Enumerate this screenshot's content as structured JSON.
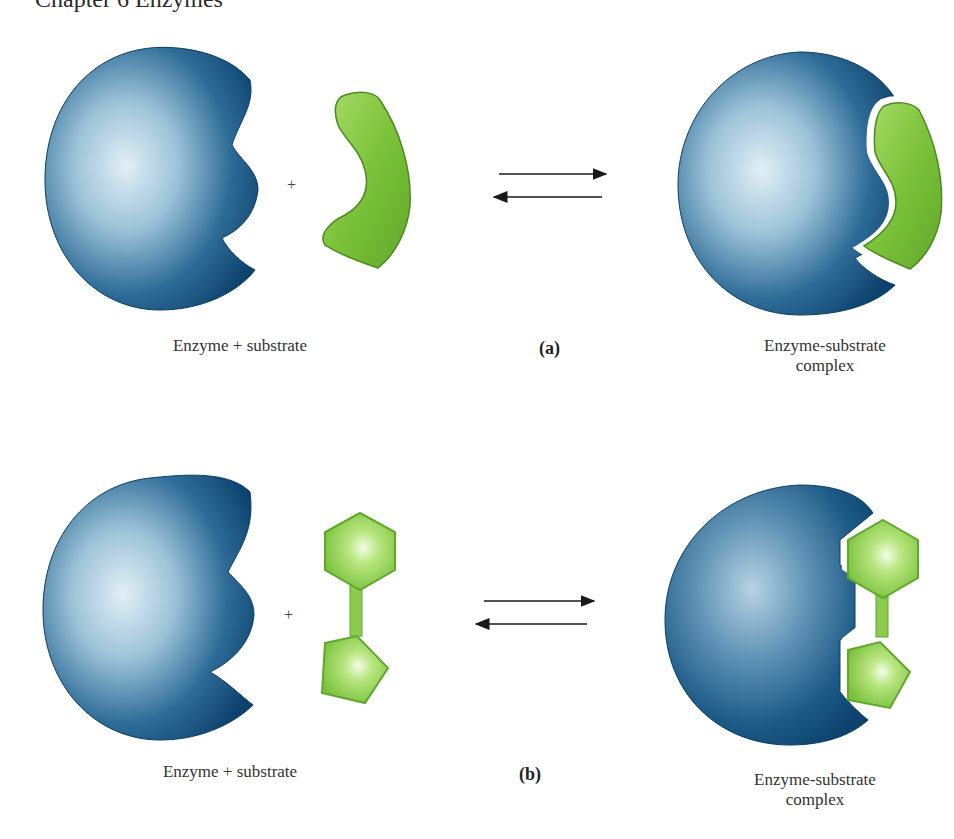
{
  "header": {
    "text": "Chapter 6  Enzymes"
  },
  "panels": [
    {
      "id": "a",
      "panel_label": "(a)",
      "left_label": "Enzyme + substrate",
      "operator": "+",
      "right_label_line1": "Enzyme-substrate",
      "right_label_line2": "complex",
      "substrate_shape": "curved-crescent",
      "equilibrium": "reversible-arrows"
    },
    {
      "id": "b",
      "panel_label": "(b)",
      "left_label": "Enzyme + substrate",
      "operator": "+",
      "right_label_line1": "Enzyme-substrate",
      "right_label_line2": "complex",
      "substrate_shape": "hexagon-pentagon-linked",
      "equilibrium": "reversible-arrows"
    }
  ],
  "colors": {
    "enzyme_dark": "#0f4a78",
    "enzyme_light": "#d4e6f0",
    "substrate_green": "#7cc23a",
    "substrate_light": "#c8ec9a",
    "arrow": "#1a1a1a"
  }
}
